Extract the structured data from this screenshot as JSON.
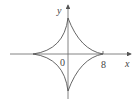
{
  "diagram": {
    "type": "astroid",
    "equation_hint": "x^(2/3) + y^(2/3) = 8^(2/3)",
    "labels": {
      "x_axis": "x",
      "y_axis": "y",
      "origin": "0",
      "x_tick": "8"
    },
    "colors": {
      "stroke": "#555555",
      "text": "#444444"
    }
  }
}
